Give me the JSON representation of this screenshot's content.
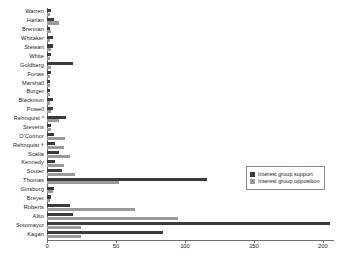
{
  "chart_data": {
    "type": "bar",
    "orientation": "horizontal",
    "title": "",
    "subtitle": "",
    "xlabel": "",
    "ylabel": "",
    "xlim": [
      0,
      208
    ],
    "ylim": null,
    "grid": false,
    "legend_position": "center-right",
    "colors": {
      "support": "#3b3b3b",
      "opposition": "#9a9a9a",
      "axis": "#6e6e6e",
      "text": "#1a1a1a",
      "background": "#ffffff"
    },
    "xticks": [
      {
        "value": 0,
        "label": "0"
      },
      {
        "value": 50,
        "label": "50"
      },
      {
        "value": 100,
        "label": "100"
      },
      {
        "value": 150,
        "label": "150"
      },
      {
        "value": 200,
        "label": "200"
      }
    ],
    "categories": [
      "Warren",
      "Harlan",
      "Brennan",
      "Whitaker",
      "Stewart",
      "White",
      "Goldberg",
      "Fortas",
      "Marshall",
      "Burger",
      "Blackmun",
      "Powell",
      "Rehnquist *",
      "Stevens",
      "O'Connor",
      "Rehnquist †",
      "Scalia",
      "Kennedy",
      "Souter",
      "Thomas",
      "Ginsburg",
      "Breyer",
      "Roberts",
      "Alito",
      "Sotomayor",
      "Kagan"
    ],
    "series": [
      {
        "name": "Interest group support",
        "color": "#3b3b3b",
        "values": [
          3,
          5,
          2,
          4,
          4,
          3,
          19,
          3,
          2,
          2,
          4,
          4,
          14,
          3,
          5,
          6,
          9,
          6,
          11,
          116,
          5,
          3,
          17,
          19,
          205,
          84
        ]
      },
      {
        "name": "Interest group opposition",
        "color": "#9a9a9a",
        "values": [
          2,
          9,
          3,
          2,
          3,
          2,
          3,
          2,
          2,
          2,
          2,
          3,
          9,
          3,
          13,
          12,
          17,
          12,
          20,
          52,
          4,
          2,
          64,
          95,
          25,
          25
        ]
      }
    ],
    "legend": [
      {
        "label": "Interest group support",
        "swatch": "support"
      },
      {
        "label": "Interest group opposition",
        "swatch": "opposition"
      }
    ]
  }
}
